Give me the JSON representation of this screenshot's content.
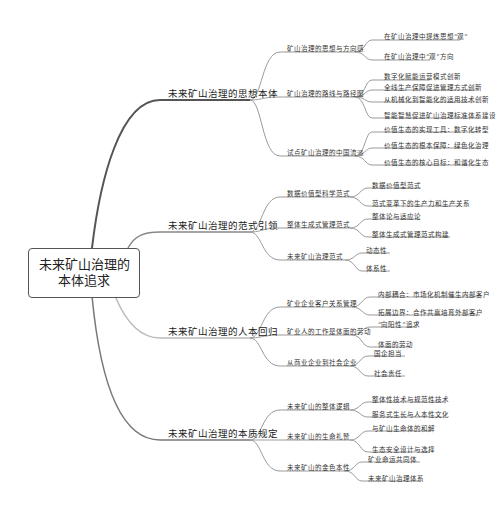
{
  "root": {
    "line1": "未来矿山治理的",
    "line2": "本体追求"
  },
  "branches": [
    {
      "label": "未来矿山治理的思想本体",
      "children": [
        {
          "label": "矿山治理的思想与方向感",
          "leaves": [
            "在矿山治理中提炼思想“观”",
            "在矿山治理中“观”方向"
          ]
        },
        {
          "label": "矿山治理的路线与路径图",
          "leaves": [
            "数字化赋能运营模式创新",
            "全线生产保障促进管理方式创新",
            "从机械化到智能化的适用技术创新",
            "智能智慧促进矿山治理标准体系建设"
          ]
        },
        {
          "label": "试点矿山治理的中国流派",
          "leaves": [
            "价值生态的实现工具：数字化转型",
            "价值生态的根本保障：绿色化治理",
            "价值生态的核心目标：和谐化生态"
          ]
        }
      ]
    },
    {
      "label": "未来矿山治理的范式引领",
      "children": [
        {
          "label": "数据价值型科学范式",
          "leaves": [
            "数据价值型范式",
            "范式变革下的生产力和生产关系"
          ]
        },
        {
          "label": "整体生成式管理范式",
          "leaves": [
            "整体论与适应论",
            "整体生成式管理范式构建"
          ]
        },
        {
          "label": "未来矿山治理范式",
          "leaves": [
            "动态性",
            "体系性"
          ]
        }
      ]
    },
    {
      "label": "未来矿山治理的人本回归",
      "children": [
        {
          "label": "矿业企业客户关系管理",
          "leaves": [
            "内部耦合：市场化机制催生内部客户",
            "拓展边界：合作共赢培育外部客户"
          ]
        },
        {
          "label": "矿业人的工作是体面的劳动",
          "leaves": [
            "“向阳性”追求",
            "体面的劳动"
          ]
        },
        {
          "label": "从商业企业到社会企业",
          "leaves": [
            "国企担当",
            "社会责任"
          ]
        }
      ]
    },
    {
      "label": "未来矿山治理的本质规定",
      "children": [
        {
          "label": "未来矿山的整体逻辑",
          "leaves": [
            "整体性技术与规范性技术",
            "服务式生长与人本性文化"
          ]
        },
        {
          "label": "未来矿山的生命礼赞",
          "leaves": [
            "与矿山生命体的和解",
            "生态安全设计与选择"
          ]
        },
        {
          "label": "未来矿山的金色本性",
          "leaves": [
            "矿业命运共同体",
            "未来矿山治理体系"
          ]
        }
      ]
    }
  ],
  "colors": {
    "line": "#999999",
    "trunk": "#555555",
    "text": "#222222"
  }
}
